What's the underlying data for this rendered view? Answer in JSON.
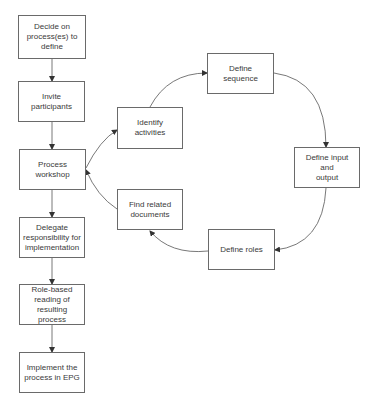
{
  "diagram": {
    "type": "flowchart",
    "main_flow": [
      {
        "id": "decide",
        "label": "Decide on\nprocess(es) to\ndefine"
      },
      {
        "id": "invite",
        "label": "Invite participants"
      },
      {
        "id": "workshop",
        "label": "Process workshop"
      },
      {
        "id": "delegate",
        "label": "Delegate\nresponsibility for\nimplementation"
      },
      {
        "id": "rolebased",
        "label": "Role-based\nreading of\nresulting process"
      },
      {
        "id": "implement",
        "label": "Implement the\nprocess in EPG"
      }
    ],
    "workshop_cycle": [
      {
        "id": "identify",
        "label": "Identify activities"
      },
      {
        "id": "sequence",
        "label": "Define sequence"
      },
      {
        "id": "inout",
        "label": "Define input and\noutput"
      },
      {
        "id": "roles",
        "label": "Define roles"
      },
      {
        "id": "finddocs",
        "label": "Find related\ndocuments"
      }
    ],
    "edges": [
      {
        "from": "decide",
        "to": "invite"
      },
      {
        "from": "invite",
        "to": "workshop"
      },
      {
        "from": "workshop",
        "to": "delegate"
      },
      {
        "from": "delegate",
        "to": "rolebased"
      },
      {
        "from": "rolebased",
        "to": "implement"
      },
      {
        "from": "workshop",
        "to": "identify"
      },
      {
        "from": "identify",
        "to": "sequence"
      },
      {
        "from": "sequence",
        "to": "inout"
      },
      {
        "from": "inout",
        "to": "roles"
      },
      {
        "from": "roles",
        "to": "finddocs"
      },
      {
        "from": "finddocs",
        "to": "workshop"
      }
    ],
    "colors": {
      "line": "#555555",
      "border": "#6a6a6a",
      "text": "#3a3a3a",
      "background": "#ffffff"
    }
  }
}
